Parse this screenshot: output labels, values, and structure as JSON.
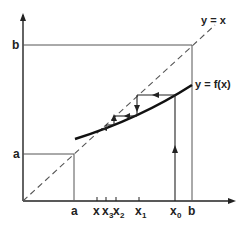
{
  "diagram": {
    "type": "cobweb fixed-point iteration",
    "labels": {
      "identity_line": "y = x",
      "function_curve": "y = f(x)",
      "y_axis_b": "b",
      "y_axis_a": "a",
      "x_axis_a": "a",
      "x_axis_b": "b",
      "x_fixed": "x",
      "x3": "x",
      "x3_sub": "3",
      "x2": "x",
      "x2_sub": "2",
      "x1": "x",
      "x1_sub": "1",
      "x0": "x",
      "x0_sub": "0"
    },
    "colors": {
      "line": "#222222",
      "thin_line": "#444444",
      "background": "#ffffff"
    }
  }
}
